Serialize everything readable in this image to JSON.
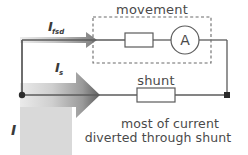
{
  "diagram": {
    "labels": {
      "movement": "movement",
      "shunt": "shunt",
      "ammeter_symbol": "A",
      "current_fsd_main": "I",
      "current_fsd_sub": "fsd",
      "current_shunt_main": "I",
      "current_shunt_sub": "s",
      "current_total": "I"
    },
    "caption": {
      "line1": "most of current",
      "line2": "diverted through shunt"
    },
    "colors": {
      "wire": "#5b5b5b",
      "text": "#4a4a4a",
      "node": "#2b2b2b",
      "dashed_box": "#6a6a6a",
      "arrow_light": "#e2e2e2",
      "arrow_dark": "#6e6e6e",
      "block_gray": "#d9d9d9",
      "background": "#ffffff"
    },
    "components": [
      {
        "name": "meter-resistor",
        "type": "resistor",
        "branch": "movement"
      },
      {
        "name": "ammeter",
        "type": "meter",
        "branch": "movement",
        "symbol": "A"
      },
      {
        "name": "shunt-resistor",
        "type": "resistor",
        "branch": "shunt"
      }
    ],
    "arrows": [
      {
        "name": "fsd-current-arrow",
        "direction": "right",
        "weight": "thin"
      },
      {
        "name": "shunt-current-arrow",
        "direction": "right",
        "weight": "thick"
      }
    ]
  }
}
